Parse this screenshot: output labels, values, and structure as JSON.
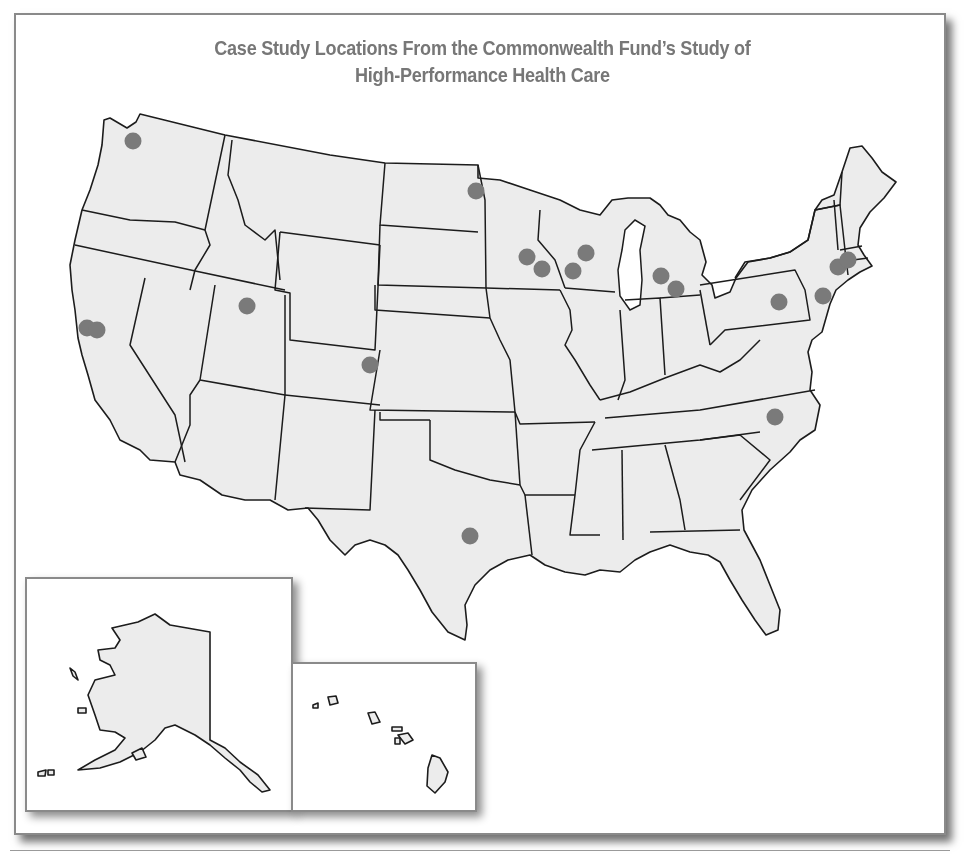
{
  "figure": {
    "title_line1": "Case Study Locations From the Commonwealth Fund’s Study of",
    "title_line2": "High-Performance Health Care"
  },
  "colors": {
    "title": "#777777",
    "land_fill": "#ececec",
    "borders": "#1c1c1c",
    "marker": "#7a7a7a",
    "frame": "#8a8a8a"
  },
  "insets": [
    {
      "name": "Alaska"
    },
    {
      "name": "Hawaii"
    }
  ],
  "markers": [
    {
      "state": "WA",
      "x": 133,
      "y": 141
    },
    {
      "state": "CA",
      "x": 87,
      "y": 328
    },
    {
      "state": "CA",
      "x": 97,
      "y": 330
    },
    {
      "state": "UT",
      "x": 247,
      "y": 306
    },
    {
      "state": "CO",
      "x": 370,
      "y": 365
    },
    {
      "state": "ND",
      "x": 476,
      "y": 191
    },
    {
      "state": "MN",
      "x": 527,
      "y": 257
    },
    {
      "state": "MN",
      "x": 542,
      "y": 269
    },
    {
      "state": "WI",
      "x": 586,
      "y": 253
    },
    {
      "state": "WI",
      "x": 573,
      "y": 271
    },
    {
      "state": "MI",
      "x": 661,
      "y": 276
    },
    {
      "state": "MI",
      "x": 676,
      "y": 289
    },
    {
      "state": "PA",
      "x": 779,
      "y": 302
    },
    {
      "state": "NY",
      "x": 823,
      "y": 296
    },
    {
      "state": "MA",
      "x": 838,
      "y": 267
    },
    {
      "state": "MA",
      "x": 848,
      "y": 260
    },
    {
      "state": "NC",
      "x": 775,
      "y": 417
    },
    {
      "state": "TX",
      "x": 470,
      "y": 536
    }
  ]
}
